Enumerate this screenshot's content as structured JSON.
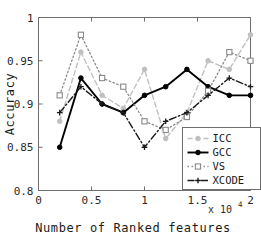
{
  "chart_data": {
    "type": "line",
    "title": "",
    "xlabel": "Number of Ranked features",
    "ylabel": "Accuracy",
    "x_exponent_label": "x 10",
    "x_exponent_power": "4",
    "xlim": [
      0,
      2
    ],
    "ylim": [
      0.8,
      1
    ],
    "xticks": [
      "0",
      "0.5",
      "1",
      "1.5",
      "2"
    ],
    "xtick_values": [
      0,
      0.5,
      1,
      1.5,
      2
    ],
    "yticks": [
      "0.8",
      "0.85",
      "0.9",
      "0.95",
      "1"
    ],
    "ytick_values": [
      0.8,
      0.85,
      0.9,
      0.95,
      1
    ],
    "grid": false,
    "legend_position": "lower right",
    "x": [
      0.2,
      0.4,
      0.6,
      0.8,
      1.0,
      1.2,
      1.4,
      1.6,
      1.8,
      2.0
    ],
    "series": [
      {
        "name": "ICC",
        "values": [
          0.88,
          0.96,
          0.91,
          0.895,
          0.94,
          0.86,
          0.89,
          0.95,
          0.94,
          0.98
        ],
        "color": "#c0c0c0",
        "dash": "5,3",
        "marker": "circle",
        "marker_filled": true,
        "width": 1.4
      },
      {
        "name": "GCC",
        "values": [
          0.85,
          0.93,
          0.9,
          0.89,
          0.91,
          0.92,
          0.94,
          0.92,
          0.91,
          0.91
        ],
        "color": "#000000",
        "dash": "",
        "marker": "circle",
        "marker_filled": true,
        "width": 1.9
      },
      {
        "name": "VS",
        "values": [
          0.91,
          0.98,
          0.93,
          0.92,
          0.88,
          0.87,
          0.885,
          0.915,
          0.96,
          0.95
        ],
        "color": "#8a8a8a",
        "dash": "1.5,2.5",
        "marker": "square",
        "marker_filled": false,
        "width": 1.3
      },
      {
        "name": "XCODE",
        "values": [
          0.89,
          0.92,
          0.9,
          0.89,
          0.85,
          0.88,
          0.89,
          0.91,
          0.93,
          0.92
        ],
        "color": "#1a1a1a",
        "dash": "7,2.5,1.5,2.5",
        "marker": "plus",
        "marker_filled": true,
        "width": 1.4
      }
    ]
  },
  "legend": {
    "entries": [
      "ICC",
      "GCC",
      "VS",
      "XCODE"
    ]
  }
}
